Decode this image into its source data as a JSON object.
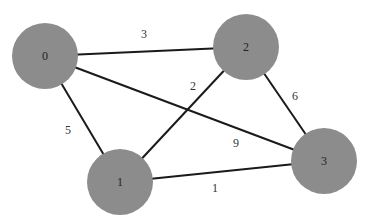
{
  "diagram": {
    "type": "weighted-undirected-graph",
    "node_color": "#8c8c8c",
    "edge_color": "#1a1a1a",
    "nodes": [
      {
        "id": "0",
        "label": "0",
        "x": 45,
        "y": 56,
        "r": 33
      },
      {
        "id": "1",
        "label": "1",
        "x": 120,
        "y": 182,
        "r": 33
      },
      {
        "id": "2",
        "label": "2",
        "x": 246,
        "y": 47,
        "r": 33
      },
      {
        "id": "3",
        "label": "3",
        "x": 324,
        "y": 161,
        "r": 33
      }
    ],
    "edges": [
      {
        "from": "0",
        "to": "2",
        "weight": "3",
        "label_x": 144,
        "label_y": 34
      },
      {
        "from": "0",
        "to": "1",
        "weight": "5",
        "label_x": 68,
        "label_y": 130
      },
      {
        "from": "0",
        "to": "3",
        "weight": "9",
        "label_x": 236,
        "label_y": 143
      },
      {
        "from": "1",
        "to": "2",
        "weight": "2",
        "label_x": 193,
        "label_y": 86
      },
      {
        "from": "2",
        "to": "3",
        "weight": "6",
        "label_x": 295,
        "label_y": 96
      },
      {
        "from": "1",
        "to": "3",
        "weight": "1",
        "label_x": 215,
        "label_y": 188
      }
    ]
  }
}
